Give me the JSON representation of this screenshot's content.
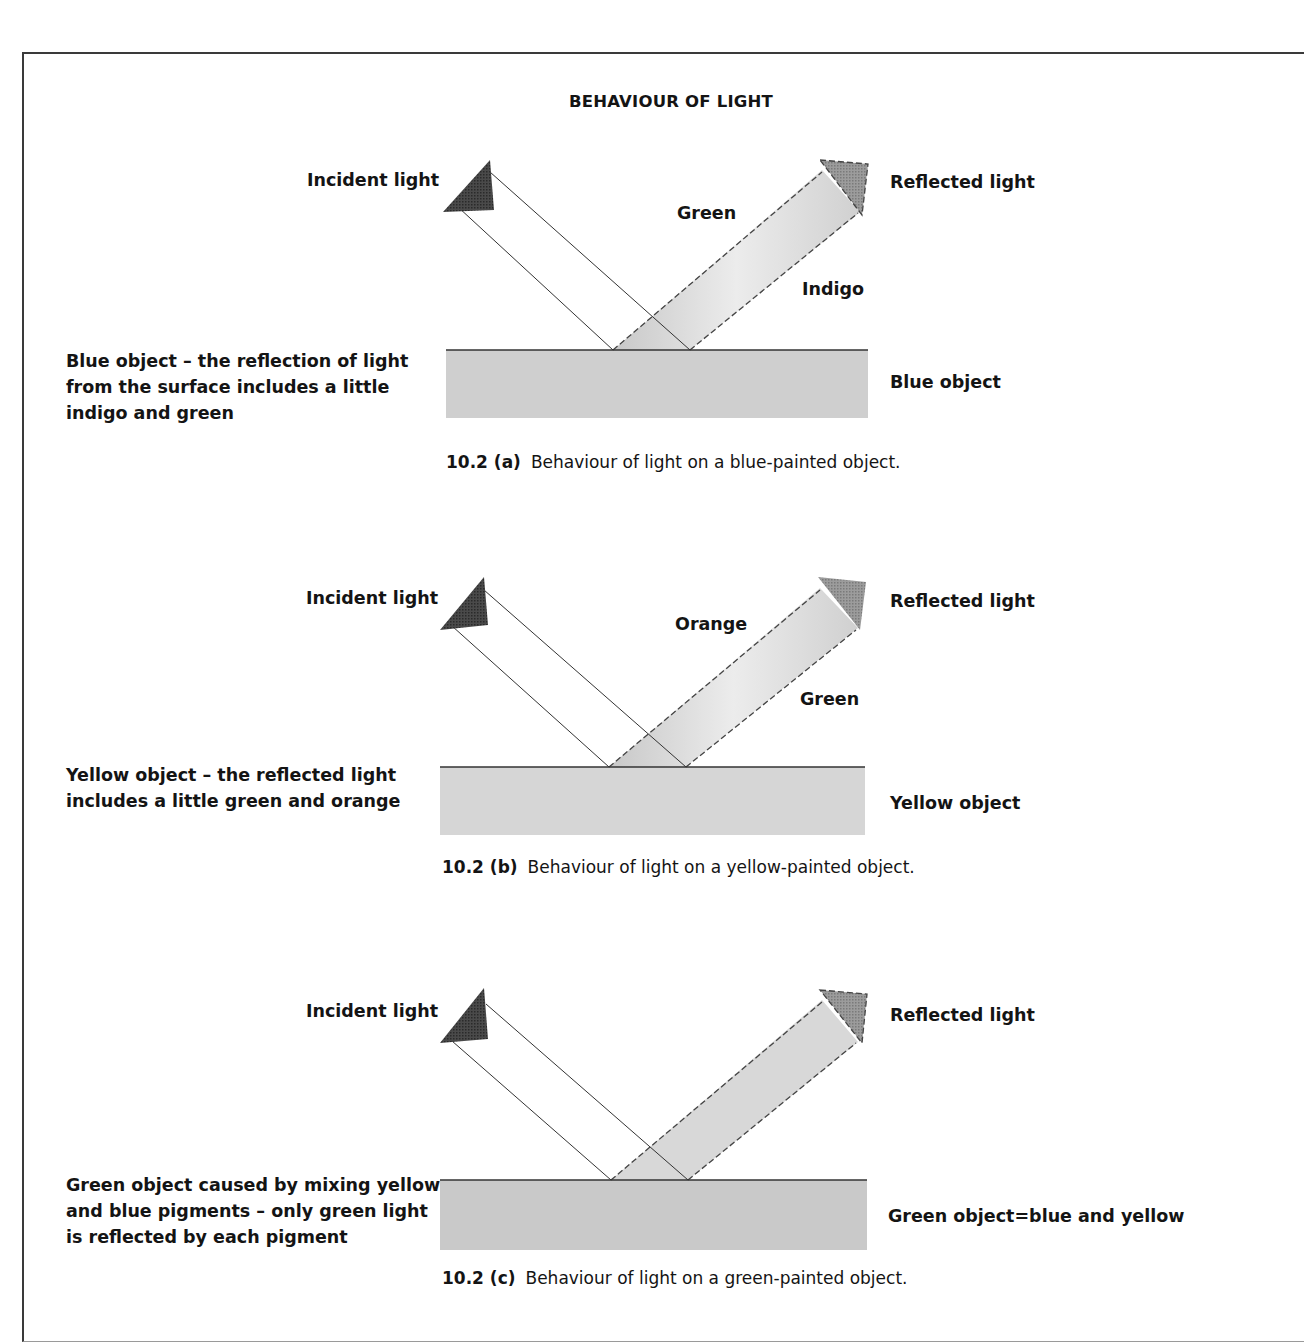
{
  "figure": {
    "title": "BEHAVIOUR OF LIGHT",
    "colors": {
      "surface_fill": "#d2d2d2",
      "surface_line": "#333333",
      "incident_head": "#3c3c3c",
      "reflected_head": "#9a9a9a",
      "reflected_beam": "#dcdcdc"
    },
    "panels": [
      {
        "id": "a",
        "incident_label": "Incident light",
        "reflected_label": "Reflected light",
        "beam_label_upper": "Green",
        "beam_label_lower": "Indigo",
        "object_label": "Blue object",
        "side_note": [
          "Blue object – the reflection of light",
          "from the surface includes a little",
          "indigo and green"
        ],
        "caption_number": "10.2 (a)",
        "caption_text": "Behaviour of light on a blue-painted object."
      },
      {
        "id": "b",
        "incident_label": "Incident light",
        "reflected_label": "Reflected light",
        "beam_label_upper": "Orange",
        "beam_label_lower": "Green",
        "object_label": "Yellow object",
        "side_note": [
          "Yellow object – the reflected light",
          "includes a little green and orange"
        ],
        "caption_number": "10.2 (b)",
        "caption_text": "Behaviour of light on a yellow-painted object."
      },
      {
        "id": "c",
        "incident_label": "Incident light",
        "reflected_label": "Reflected light",
        "object_label": "Green object=blue and yellow",
        "side_note": [
          "Green object caused by mixing yellow",
          "and blue pigments – only green light",
          "is reflected by each pigment"
        ],
        "caption_number": "10.2 (c)",
        "caption_text": "Behaviour of light on a green-painted object."
      }
    ]
  }
}
